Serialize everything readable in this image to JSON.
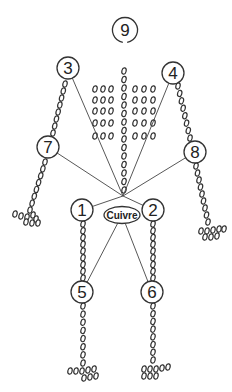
{
  "diagram": {
    "center_label": "Cuivre",
    "points": [
      {
        "id": "1",
        "label": "1",
        "region": "left-hip"
      },
      {
        "id": "2",
        "label": "2",
        "region": "right-hip"
      },
      {
        "id": "3",
        "label": "3",
        "region": "left-shoulder"
      },
      {
        "id": "4",
        "label": "4",
        "region": "right-shoulder"
      },
      {
        "id": "5",
        "label": "5",
        "region": "left-knee"
      },
      {
        "id": "6",
        "label": "6",
        "region": "right-knee"
      },
      {
        "id": "7",
        "label": "7",
        "region": "left-elbow"
      },
      {
        "id": "8",
        "label": "8",
        "region": "right-elbow"
      },
      {
        "id": "9",
        "label": "9",
        "region": "head"
      }
    ],
    "connections": [
      [
        "hub",
        "3"
      ],
      [
        "hub",
        "4"
      ],
      [
        "hub",
        "7"
      ],
      [
        "hub",
        "8"
      ],
      [
        "hub",
        "1"
      ],
      [
        "hub",
        "2"
      ],
      [
        "Cuivre",
        "5"
      ],
      [
        "Cuivre",
        "6"
      ]
    ],
    "colors": {
      "ink": "#333333",
      "background": "#ffffff"
    }
  }
}
